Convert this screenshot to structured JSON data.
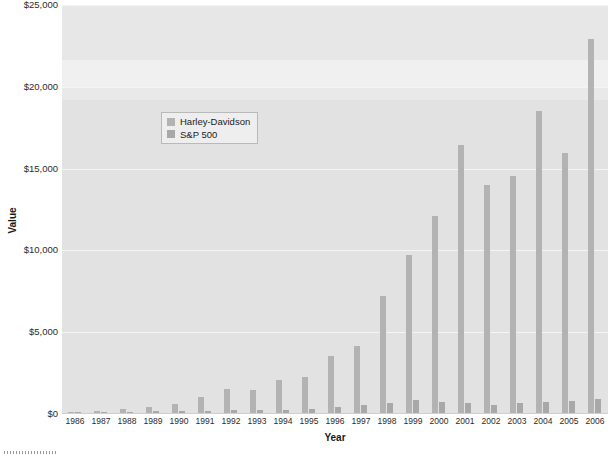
{
  "chart_data": {
    "type": "bar",
    "title": "",
    "xlabel": "Year",
    "ylabel": "Value",
    "categories": [
      "1986",
      "1987",
      "1988",
      "1989",
      "1990",
      "1991",
      "1992",
      "1993",
      "1994",
      "1995",
      "1996",
      "1997",
      "1998",
      "1999",
      "2000",
      "2001",
      "2002",
      "2003",
      "2004",
      "2005",
      "2006"
    ],
    "series": [
      {
        "name": "Harley-Davidson",
        "color": "#b3b3b3",
        "values": [
          100,
          180,
          300,
          450,
          600,
          1050,
          1550,
          1450,
          2050,
          2250,
          3550,
          4150,
          7200,
          9700,
          12100,
          16450,
          14000,
          14550,
          18500,
          15950,
          22950
        ]
      },
      {
        "name": "S&P 500",
        "color": "#a8a8a8",
        "values": [
          100,
          105,
          120,
          160,
          155,
          200,
          215,
          235,
          240,
          330,
          405,
          540,
          695,
          840,
          765,
          675,
          525,
          675,
          750,
          785,
          910
        ]
      }
    ],
    "ylim": [
      0,
      25000
    ],
    "yticks": [
      0,
      5000,
      10000,
      15000,
      20000,
      25000
    ],
    "ytick_labels": [
      "$0",
      "$5,000",
      "$10,000",
      "$15,000",
      "$20,000",
      "$25,000"
    ],
    "grid": true,
    "legend_position": "upper-left"
  },
  "axes": {
    "y_title": "Value",
    "x_title": "Year"
  },
  "legend": {
    "items": [
      {
        "label": "Harley-Davidson",
        "color": "#b3b3b3"
      },
      {
        "label": "S&P 500",
        "color": "#a8a8a8"
      }
    ]
  },
  "colors": {
    "plot_background": "#e2e2e2",
    "gridline": "#f4f4f4",
    "page_background": "#ffffff",
    "text": "#1a1a1a"
  }
}
